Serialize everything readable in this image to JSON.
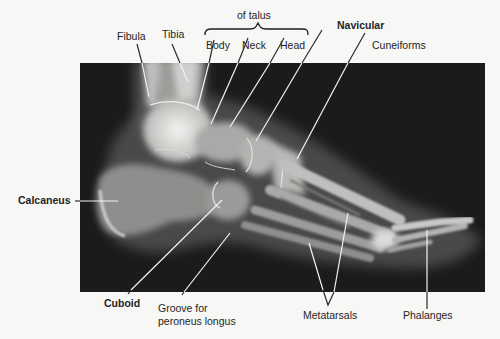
{
  "figure": {
    "colors": {
      "background": "#f7f7f5",
      "xray_background": "#1b1b1b",
      "bone": "#e8e8e6",
      "leader_line_on_xray": "#f2f2f2",
      "leader_line_on_paper": "#2a2a2a",
      "label_text": "#1f1f1f"
    },
    "xray_region": {
      "x": 80,
      "y": 63,
      "width": 405,
      "height": 229
    }
  },
  "group": {
    "talus_caption": "of talus"
  },
  "labels": [
    {
      "id": "fibula",
      "text": "Fibula",
      "bold": false
    },
    {
      "id": "tibia",
      "text": "Tibia",
      "bold": false
    },
    {
      "id": "body",
      "text": "Body",
      "bold": false
    },
    {
      "id": "neck",
      "text": "Neck",
      "bold": false
    },
    {
      "id": "head",
      "text": "Head",
      "bold": false
    },
    {
      "id": "navicular",
      "text": "Navicular",
      "bold": true
    },
    {
      "id": "cuneiforms",
      "text": "Cuneiforms",
      "bold": false
    },
    {
      "id": "calcaneus",
      "text": "Calcaneus",
      "bold": true
    },
    {
      "id": "cuboid",
      "text": "Cuboid",
      "bold": true
    },
    {
      "id": "groove",
      "text": "Groove for",
      "text2": "peroneus longus",
      "bold": false
    },
    {
      "id": "metatarsals",
      "text": "Metatarsals",
      "bold": false
    },
    {
      "id": "phalanges",
      "text": "Phalanges",
      "bold": false
    }
  ]
}
